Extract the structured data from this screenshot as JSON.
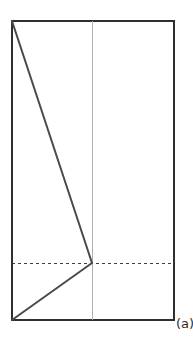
{
  "figure": {
    "panel_label": "(a)",
    "background_color": "#ffffff",
    "canvas": {
      "width": 193,
      "height": 337
    },
    "colors": {
      "outline": "#2f2f2f",
      "fold_line": "#4a4a4a",
      "center_line": "#b0b0b0",
      "dashed_line": "#3d3d3d",
      "label_text": "#2b2b2b"
    },
    "geometry": {
      "sheet_rect": {
        "x": 12,
        "y": 21,
        "width": 162,
        "height": 299
      },
      "center_vertical_line": {
        "x": 92,
        "y1": 21,
        "y2": 320
      },
      "dashed_horizontal_line": {
        "y": 263,
        "x1": 12,
        "x2": 174
      },
      "upper_fold_line": {
        "x1": 12,
        "y1": 21,
        "x2": 92,
        "y2": 263
      },
      "lower_fold_line": {
        "x1": 12,
        "y1": 320,
        "x2": 92,
        "y2": 263
      },
      "vertex_point": {
        "x": 92,
        "y": 263
      }
    },
    "strokes": {
      "outline_width": 2,
      "fold_width": 2,
      "center_width": 1,
      "dashed_width": 1,
      "dash_pattern": "3 3"
    }
  },
  "chart_data": {
    "type": "diagram",
    "title": "(a)",
    "elements": [
      {
        "name": "sheet-outline",
        "shape": "rectangle",
        "x": 12,
        "y": 21,
        "width": 162,
        "height": 299,
        "style": "solid",
        "color": "#2f2f2f"
      },
      {
        "name": "center-crease",
        "shape": "line",
        "points": [
          [
            92,
            21
          ],
          [
            92,
            320
          ]
        ],
        "style": "solid",
        "color": "#b0b0b0"
      },
      {
        "name": "horizontal-fold",
        "shape": "line",
        "points": [
          [
            12,
            263
          ],
          [
            174,
            263
          ]
        ],
        "style": "dashed",
        "color": "#3d3d3d"
      },
      {
        "name": "upper-fold",
        "shape": "line",
        "points": [
          [
            12,
            21
          ],
          [
            92,
            263
          ]
        ],
        "style": "solid",
        "color": "#4a4a4a"
      },
      {
        "name": "lower-fold",
        "shape": "line",
        "points": [
          [
            12,
            320
          ],
          [
            92,
            263
          ]
        ],
        "style": "solid",
        "color": "#4a4a4a"
      }
    ]
  }
}
